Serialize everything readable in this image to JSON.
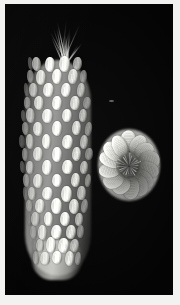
{
  "image": {
    "domain": "Natural-Image",
    "kind": "black-and-white photographic plate",
    "width": 180,
    "height": 305,
    "caption_text": "",
    "visible_text": [],
    "background_color": "#040404",
    "border_color": "#f2f2f1"
  },
  "subjects": [
    {
      "id": "maize-ear-side",
      "label": "ear of maize, side view",
      "position": "left",
      "bounds": {
        "x": 18,
        "y": 14,
        "width": 70,
        "height": 260
      },
      "tone_range": {
        "highlight": "#f4f4f0",
        "midtone": "#c8c8c4",
        "shadow": "#3c3c3a"
      },
      "features": [
        "kernel rows",
        "silk strands at tip",
        "tapered butt end"
      ],
      "kernel_rows": 16,
      "kernels_per_row": 5
    },
    {
      "id": "maize-ear-end",
      "label": "ear of maize, end-on cross-section view",
      "position": "right",
      "bounds": {
        "x": 91,
        "y": 122,
        "width": 66,
        "height": 78
      },
      "tone_range": {
        "highlight": "#f2f2ee",
        "midtone": "#c0c0bb",
        "shadow": "#121212"
      },
      "features": [
        "radial kernel arrangement",
        "dark cob core",
        "rosette outline"
      ],
      "radial_kernels": 14
    }
  ],
  "artifacts": [
    {
      "id": "dust-speck",
      "label": "faint light speck on negative",
      "x": 104,
      "y": 96
    }
  ]
}
